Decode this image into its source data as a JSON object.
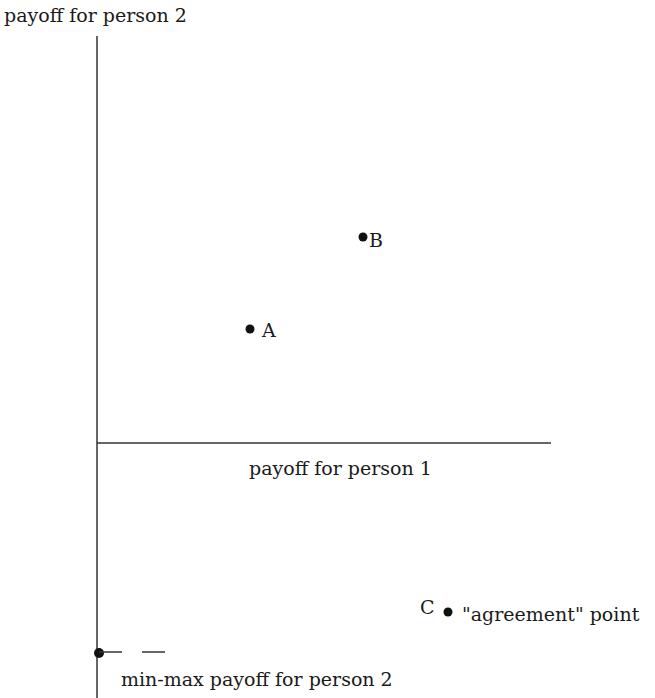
{
  "diagram": {
    "y_axis_label": "payoff for person 2",
    "x_axis_label": "payoff for person 1",
    "points": [
      {
        "id": "A",
        "label": "A",
        "x": 250,
        "y": 329
      },
      {
        "id": "B",
        "label": "B",
        "x": 363,
        "y": 237
      },
      {
        "id": "C",
        "label": "C",
        "x": 448,
        "y": 612,
        "annotation": "\"agreement\" point"
      }
    ],
    "minmax": {
      "label": "min-max payoff for person 2",
      "x": 99,
      "y": 653
    }
  },
  "colors": {
    "ink": "#1a1a1a",
    "background": "#ffffff"
  }
}
